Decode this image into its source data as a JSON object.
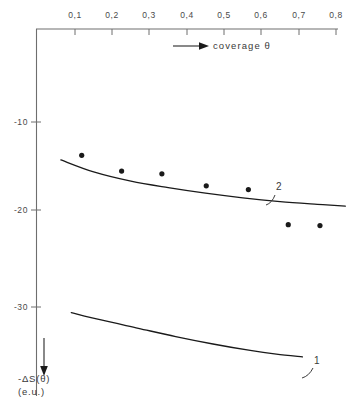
{
  "chart_data": {
    "type": "scatter",
    "title": "",
    "subtitle": "",
    "xlabel": "coverage  θ",
    "xlabel_arrow": "→",
    "ylabel_line1": "-ΔS(θ)",
    "ylabel_line2": "(e.u.)",
    "ylabel_arrow": "↓",
    "x_axis_position": "top",
    "y_axis_position": "left",
    "y_axis_direction": "downward-negative",
    "grid": false,
    "legend": "none",
    "xlim": [
      0.0,
      0.85
    ],
    "ylim": [
      -35.5,
      -5.0
    ],
    "xticks": [
      0.1,
      0.2,
      0.3,
      0.4,
      0.5,
      0.6,
      0.7,
      0.8
    ],
    "xtick_labels": [
      "0,1",
      "0,2",
      "0,3",
      "0,4",
      "0,5",
      "0,6",
      "0,7",
      "0,8"
    ],
    "yticks": [
      -10,
      -20,
      -30
    ],
    "ytick_labels": [
      "-10",
      "-20",
      "-30"
    ],
    "points": {
      "name": "experimental points",
      "marker": "filled circle",
      "color": "#1a1a1a",
      "x": [
        0.118,
        0.225,
        0.333,
        0.452,
        0.565,
        0.672,
        0.757
      ],
      "y": [
        -13.6,
        -15.3,
        -15.6,
        -16.9,
        -17.3,
        -21.1,
        -21.2
      ]
    },
    "series": [
      {
        "name": "2",
        "label": "2",
        "type": "line",
        "color": "#1a1a1a",
        "x": [
          0.062,
          0.15,
          0.25,
          0.35,
          0.45,
          0.55,
          0.65,
          0.75,
          0.825
        ],
        "y": [
          -14.1,
          -15.4,
          -16.4,
          -17.1,
          -17.7,
          -18.2,
          -18.6,
          -18.9,
          -19.1
        ]
      },
      {
        "name": "1",
        "label": "1",
        "type": "line",
        "color": "#1a1a1a",
        "x": [
          0.09,
          0.17,
          0.27,
          0.37,
          0.47,
          0.57,
          0.64,
          0.71
        ],
        "y": [
          -30.6,
          -31.4,
          -32.3,
          -33.2,
          -34.0,
          -34.7,
          -35.1,
          -35.4
        ]
      }
    ]
  },
  "annotations": {
    "curve_label_2": "2",
    "curve_label_1": "1"
  }
}
